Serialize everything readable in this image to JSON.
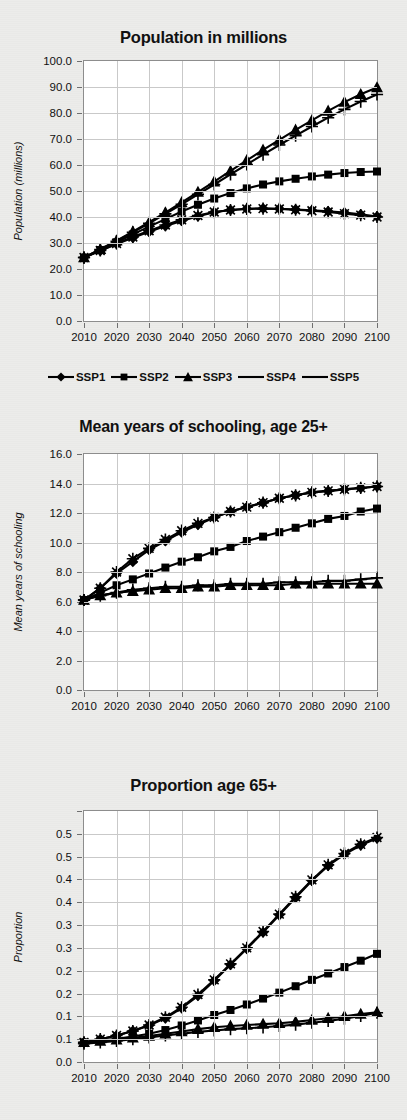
{
  "figure": {
    "background": "#ececea",
    "panel_count": 3
  },
  "legend": {
    "position": "below-panel-1",
    "entries": [
      {
        "label": "SSP1",
        "marker": "diamond"
      },
      {
        "label": "SSP2",
        "marker": "square"
      },
      {
        "label": "SSP3",
        "marker": "triangle"
      },
      {
        "label": "SSP4",
        "marker": "plus"
      },
      {
        "label": "SSP5",
        "marker": "asterisk"
      }
    ]
  },
  "chart_data": [
    {
      "type": "line",
      "title": "Population in millions",
      "xlabel": "",
      "ylabel": "Population (millions)",
      "grid": true,
      "legend_position": "bottom",
      "x": [
        2010,
        2015,
        2020,
        2025,
        2030,
        2035,
        2040,
        2045,
        2050,
        2055,
        2060,
        2065,
        2070,
        2075,
        2080,
        2085,
        2090,
        2095,
        2100
      ],
      "xticks": [
        "2010",
        "2020",
        "2030",
        "2040",
        "2050",
        "2060",
        "2070",
        "2080",
        "2090",
        "2100"
      ],
      "yticks": [
        "0.0",
        "10.0",
        "20.0",
        "30.0",
        "40.0",
        "50.0",
        "60.0",
        "70.0",
        "80.0",
        "90.0",
        "100.0"
      ],
      "ylim": [
        0,
        100
      ],
      "xlim": [
        2010,
        2100
      ],
      "series": [
        {
          "name": "SSP1",
          "marker": "diamond",
          "values": [
            24.4,
            27.0,
            29.6,
            32.0,
            34.3,
            36.5,
            38.5,
            40.3,
            41.8,
            42.7,
            43.2,
            43.3,
            43.2,
            42.9,
            42.6,
            42.2,
            41.7,
            41.0,
            40.2
          ]
        },
        {
          "name": "SSP2",
          "marker": "square",
          "values": [
            24.4,
            27.3,
            30.3,
            33.3,
            36.3,
            39.2,
            42.1,
            44.7,
            47.1,
            49.2,
            51.0,
            52.5,
            53.7,
            54.7,
            55.6,
            56.3,
            56.9,
            57.3,
            57.5
          ]
        },
        {
          "name": "SSP3",
          "marker": "triangle",
          "values": [
            24.4,
            27.6,
            30.9,
            34.4,
            38.0,
            41.7,
            45.6,
            49.6,
            53.6,
            57.7,
            61.8,
            65.8,
            69.7,
            73.5,
            77.2,
            80.8,
            84.2,
            87.2,
            89.8
          ]
        },
        {
          "name": "SSP4",
          "marker": "plus",
          "values": [
            24.4,
            27.5,
            30.7,
            34.1,
            37.6,
            41.2,
            44.9,
            48.7,
            52.5,
            56.4,
            60.2,
            64.0,
            67.7,
            71.3,
            74.8,
            78.2,
            81.4,
            84.4,
            87.1
          ]
        },
        {
          "name": "SSP5",
          "marker": "asterisk",
          "values": [
            24.4,
            27.1,
            29.8,
            32.3,
            34.7,
            36.9,
            38.9,
            40.6,
            41.9,
            42.7,
            43.1,
            43.2,
            43.1,
            42.8,
            42.4,
            41.9,
            41.3,
            40.7,
            40.0
          ]
        }
      ]
    },
    {
      "type": "line",
      "title": "Mean years of schooling, age 25+",
      "xlabel": "",
      "ylabel": "Mean years of schooling",
      "grid": true,
      "legend_position": "none",
      "x": [
        2010,
        2015,
        2020,
        2025,
        2030,
        2035,
        2040,
        2045,
        2050,
        2055,
        2060,
        2065,
        2070,
        2075,
        2080,
        2085,
        2090,
        2095,
        2100
      ],
      "xticks": [
        "2010",
        "2020",
        "2030",
        "2040",
        "2050",
        "2060",
        "2070",
        "2080",
        "2090",
        "2100"
      ],
      "yticks": [
        "0.0",
        "2.0",
        "4.0",
        "6.0",
        "8.0",
        "10.0",
        "12.0",
        "14.0",
        "16.0"
      ],
      "ylim": [
        0,
        16
      ],
      "xlim": [
        2010,
        2100
      ],
      "series": [
        {
          "name": "SSP1",
          "marker": "diamond",
          "values": [
            6.1,
            6.9,
            7.9,
            8.7,
            9.5,
            10.1,
            10.7,
            11.2,
            11.7,
            12.1,
            12.4,
            12.7,
            13.0,
            13.2,
            13.4,
            13.5,
            13.6,
            13.7,
            13.8
          ]
        },
        {
          "name": "SSP2",
          "marker": "square",
          "values": [
            6.1,
            6.6,
            7.1,
            7.5,
            7.9,
            8.3,
            8.7,
            9.0,
            9.4,
            9.7,
            10.1,
            10.4,
            10.7,
            11.0,
            11.3,
            11.6,
            11.8,
            12.1,
            12.3
          ]
        },
        {
          "name": "SSP3",
          "marker": "triangle",
          "values": [
            6.1,
            6.4,
            6.6,
            6.7,
            6.8,
            6.9,
            6.9,
            7.0,
            7.0,
            7.1,
            7.1,
            7.1,
            7.1,
            7.2,
            7.2,
            7.2,
            7.2,
            7.2,
            7.2
          ]
        },
        {
          "name": "SSP4",
          "marker": "plus",
          "values": [
            6.1,
            6.4,
            6.6,
            6.8,
            6.9,
            7.0,
            7.0,
            7.1,
            7.1,
            7.2,
            7.2,
            7.2,
            7.3,
            7.3,
            7.3,
            7.4,
            7.4,
            7.5,
            7.6
          ]
        },
        {
          "name": "SSP5",
          "marker": "asterisk",
          "values": [
            6.1,
            6.9,
            8.0,
            8.9,
            9.6,
            10.2,
            10.8,
            11.3,
            11.7,
            12.1,
            12.4,
            12.7,
            13.0,
            13.2,
            13.4,
            13.5,
            13.6,
            13.7,
            13.8
          ]
        }
      ]
    },
    {
      "type": "line",
      "title": "Proportion age 65+",
      "xlabel": "",
      "ylabel": "Proportion",
      "grid": true,
      "legend_position": "none",
      "x": [
        2010,
        2015,
        2020,
        2025,
        2030,
        2035,
        2040,
        2045,
        2050,
        2055,
        2060,
        2065,
        2070,
        2075,
        2080,
        2085,
        2090,
        2095,
        2100
      ],
      "xticks": [
        "2010",
        "2020",
        "2030",
        "2040",
        "2050",
        "2060",
        "2070",
        "2080",
        "2090",
        "2100"
      ],
      "yticks": [
        "0.0",
        "0.1",
        "0.1",
        "0.2",
        "0.2",
        "0.3",
        "0.3",
        "0.4",
        "0.4",
        "0.5",
        "0.5"
      ],
      "ytick_values": [
        0.0,
        0.05,
        0.1,
        0.15,
        0.2,
        0.25,
        0.3,
        0.35,
        0.4,
        0.45,
        0.5,
        0.55
      ],
      "ylim": [
        0,
        0.55
      ],
      "xlim": [
        2010,
        2100
      ],
      "series": [
        {
          "name": "SSP1",
          "marker": "diamond",
          "values": [
            0.043,
            0.05,
            0.058,
            0.068,
            0.08,
            0.096,
            0.118,
            0.145,
            0.178,
            0.213,
            0.248,
            0.284,
            0.322,
            0.36,
            0.397,
            0.43,
            0.455,
            0.475,
            0.49
          ]
        },
        {
          "name": "SSP2",
          "marker": "square",
          "values": [
            0.043,
            0.047,
            0.051,
            0.056,
            0.062,
            0.07,
            0.08,
            0.091,
            0.103,
            0.114,
            0.126,
            0.139,
            0.152,
            0.166,
            0.18,
            0.194,
            0.208,
            0.222,
            0.237
          ]
        },
        {
          "name": "SSP3",
          "marker": "triangle",
          "values": [
            0.043,
            0.046,
            0.049,
            0.053,
            0.057,
            0.062,
            0.067,
            0.072,
            0.076,
            0.079,
            0.081,
            0.083,
            0.085,
            0.088,
            0.092,
            0.096,
            0.1,
            0.105,
            0.109
          ]
        },
        {
          "name": "SSP4",
          "marker": "plus",
          "values": [
            0.04,
            0.043,
            0.046,
            0.05,
            0.054,
            0.058,
            0.062,
            0.066,
            0.069,
            0.072,
            0.074,
            0.076,
            0.079,
            0.082,
            0.086,
            0.09,
            0.095,
            0.101,
            0.108
          ]
        },
        {
          "name": "SSP5",
          "marker": "asterisk",
          "values": [
            0.043,
            0.05,
            0.058,
            0.068,
            0.081,
            0.098,
            0.12,
            0.148,
            0.18,
            0.215,
            0.25,
            0.286,
            0.324,
            0.362,
            0.399,
            0.432,
            0.457,
            0.477,
            0.492
          ]
        }
      ]
    }
  ]
}
